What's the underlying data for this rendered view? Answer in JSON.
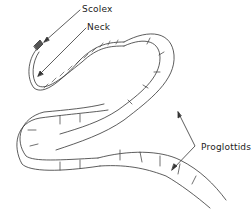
{
  "diagram": {
    "labels": {
      "scolex": "Scolex",
      "neck": "Neck",
      "proglottids": "Proglottids"
    },
    "colors": {
      "ink": "#222222",
      "background": "#ffffff"
    }
  }
}
